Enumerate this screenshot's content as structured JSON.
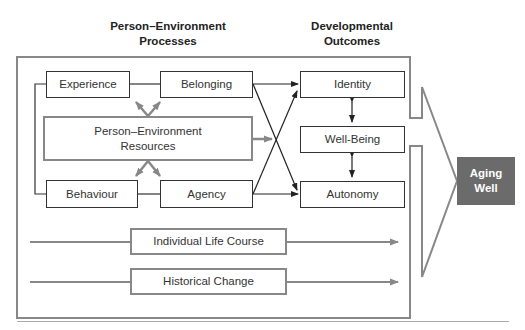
{
  "headers": {
    "left": "Person–Environment\nProcesses",
    "left_line1": "Person–Environment",
    "left_line2": "Processes",
    "right_line1": "Developmental",
    "right_line2": "Outcomes"
  },
  "processes": {
    "experience": "Experience",
    "belonging": "Belonging",
    "resources_line1": "Person–Environment",
    "resources_line2": "Resources",
    "behaviour": "Behaviour",
    "agency": "Agency"
  },
  "outcomes": {
    "identity": "Identity",
    "well_being": "Well-Being",
    "autonomy": "Autonomy"
  },
  "timelines": {
    "life_course": "Individual Life Course",
    "historical": "Historical Change"
  },
  "result": {
    "line1": "Aging",
    "line2": "Well",
    "color": "#6b6b6b"
  },
  "colors": {
    "outline": "#333333",
    "gray_outline": "#888888"
  }
}
